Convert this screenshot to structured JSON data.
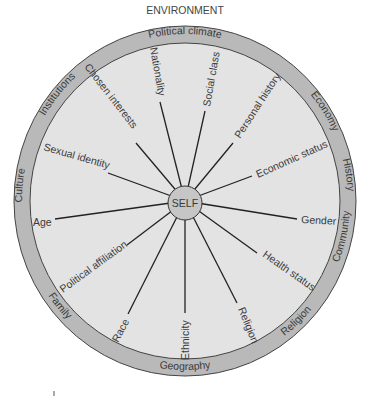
{
  "title": "ENVIRONMENT",
  "center_label": "SELF",
  "outer_ring": [
    "Political climate",
    "Economy",
    "History",
    "Community",
    "Religion",
    "Geography",
    "Family",
    "Culture",
    "Institutions"
  ],
  "spokes": [
    "Nationality",
    "Social class",
    "Personal history",
    "Economic status",
    "Gender",
    "Health status",
    "Religion",
    "Ethnicity",
    "Race",
    "Political affiliation",
    "Age",
    "Sexual identity",
    "Chosen interests"
  ],
  "colors": {
    "rim": "#b8b8b8",
    "inner": "#e2e2e2",
    "self": "#c4c4c4",
    "line": "#222222"
  }
}
